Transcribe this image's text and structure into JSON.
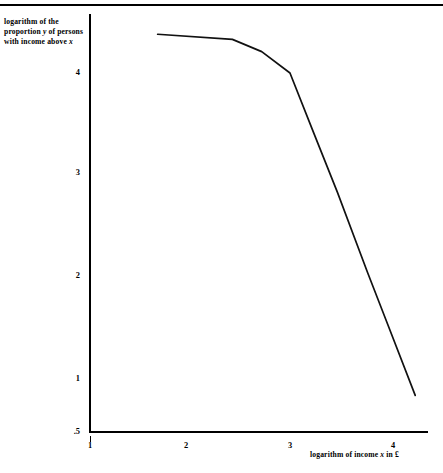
{
  "figure": {
    "top_rule": true
  },
  "axes": {
    "y_title_line1": "logarithm of the",
    "y_title_line2_pre": "proportion ",
    "y_title_line2_var": "y",
    "y_title_line2_post": " of persons",
    "y_title_line3_pre": "with income above ",
    "y_title_line3_var": "x",
    "x_title_pre": "logarithm of income ",
    "x_title_var": "x",
    "x_title_post": " in £"
  },
  "chart_data": {
    "type": "line",
    "title": "",
    "xlabel": "logarithm of income x in £",
    "ylabel": "logarithm of the proportion y of persons with income above x",
    "xlim": [
      0.99,
      4.35
    ],
    "ylim": [
      0.5,
      4.5
    ],
    "grid": false,
    "legend": "none",
    "xticks": [
      1,
      2,
      3,
      4
    ],
    "xticklabels": [
      "1",
      "2",
      "3",
      "4"
    ],
    "yticks": [
      0.5,
      1,
      2,
      3,
      4
    ],
    "yticklabels": [
      ".5",
      "1",
      "2",
      "3",
      "4"
    ],
    "series": [
      {
        "name": "income distribution",
        "x": [
          1.67,
          2.41,
          2.7,
          2.98,
          3.2,
          3.45,
          3.75,
          3.95,
          4.22
        ],
        "y": [
          4.37,
          4.32,
          4.2,
          3.99,
          3.44,
          2.82,
          2.03,
          1.52,
          0.83
        ]
      }
    ]
  },
  "ticks": {
    "y": [
      {
        "label": "4",
        "value": 4
      },
      {
        "label": "3",
        "value": 3
      },
      {
        "label": "2",
        "value": 2
      },
      {
        "label": "1",
        "value": 1
      },
      {
        "label": ".5",
        "value": 0.5
      }
    ],
    "x": [
      {
        "label": "1",
        "value": 1
      },
      {
        "label": "2",
        "value": 2
      },
      {
        "label": "3",
        "value": 3
      },
      {
        "label": "4",
        "value": 4
      }
    ]
  }
}
